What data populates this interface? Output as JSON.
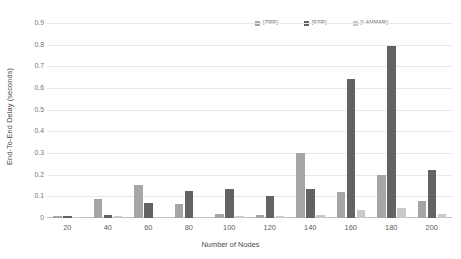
{
  "chart_data": {
    "type": "bar",
    "title": "",
    "xlabel": "Number of Nodes",
    "ylabel": "End-To-End Delay (seconds)",
    "categories": [
      "20",
      "40",
      "60",
      "80",
      "100",
      "120",
      "140",
      "160",
      "180",
      "200"
    ],
    "series": [
      {
        "name": "[ZRP]",
        "color": "#a6a6a6",
        "values": [
          0.008,
          0.09,
          0.152,
          0.065,
          0.018,
          0.012,
          0.3,
          0.118,
          0.2,
          0.078
        ]
      },
      {
        "name": "[FSR]",
        "color": "#636363",
        "values": [
          0.007,
          0.012,
          0.068,
          0.125,
          0.133,
          0.1,
          0.132,
          0.64,
          0.795,
          0.222
        ]
      },
      {
        "name": "[LANMAR]",
        "color": "#c9c9c9",
        "values": [
          0.005,
          0.007,
          0.005,
          0.006,
          0.008,
          0.01,
          0.012,
          0.038,
          0.048,
          0.018
        ]
      }
    ],
    "ylim": [
      0,
      0.9
    ],
    "yticks": [
      "0",
      "0.1",
      "0.2",
      "0.3",
      "0.4",
      "0.5",
      "0.6",
      "0.7",
      "0.8",
      "0.9"
    ],
    "grid": true,
    "legend_position": "top-right"
  },
  "legend": {
    "entries": [
      {
        "label": "[ZRP]"
      },
      {
        "label": "[FSR]"
      },
      {
        "label": "[LANMAR]"
      }
    ]
  },
  "axes": {
    "y_title": "End-To-End Delay (seconds)",
    "x_title": "Number of Nodes"
  }
}
